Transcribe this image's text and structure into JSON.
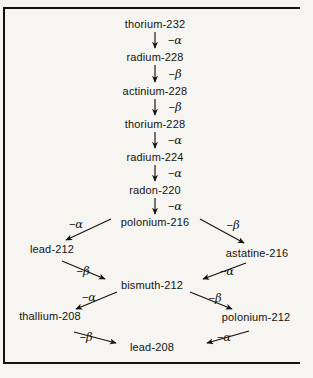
{
  "diagram": {
    "background_color": "#f6f5f1",
    "text_color": "#15130f",
    "nodes": [
      {
        "id": "th232",
        "label": "thorium-232",
        "x": 155,
        "y": 24
      },
      {
        "id": "ra228",
        "label": "radium-228",
        "x": 155,
        "y": 57
      },
      {
        "id": "ac228",
        "label": "actinium-228",
        "x": 155,
        "y": 91
      },
      {
        "id": "th228",
        "label": "thorium-228",
        "x": 155,
        "y": 124
      },
      {
        "id": "ra224",
        "label": "radium-224",
        "x": 155,
        "y": 157
      },
      {
        "id": "rn220",
        "label": "radon-220",
        "x": 155,
        "y": 190
      },
      {
        "id": "po216",
        "label": "polonium-216",
        "x": 155,
        "y": 222
      },
      {
        "id": "pb212",
        "label": "lead-212",
        "x": 52,
        "y": 249
      },
      {
        "id": "at216",
        "label": "astatine-216",
        "x": 257,
        "y": 253
      },
      {
        "id": "bi212",
        "label": "bismuth-212",
        "x": 152,
        "y": 285
      },
      {
        "id": "tl208",
        "label": "thallium-208",
        "x": 50,
        "y": 316
      },
      {
        "id": "po212",
        "label": "polonium-212",
        "x": 256,
        "y": 317
      },
      {
        "id": "pb208",
        "label": "lead-208",
        "x": 152,
        "y": 347
      }
    ],
    "transitions": [
      {
        "from": "th232",
        "to": "ra228",
        "particle": "alpha",
        "label_prefix": "−",
        "label_symbol": "α",
        "label_x": 175,
        "label_y": 40,
        "kind": "vertical"
      },
      {
        "from": "ra228",
        "to": "ac228",
        "particle": "beta",
        "label_prefix": "−",
        "label_symbol": "β",
        "label_x": 175,
        "label_y": 74,
        "kind": "vertical"
      },
      {
        "from": "ac228",
        "to": "th228",
        "particle": "beta",
        "label_prefix": "−",
        "label_symbol": "β",
        "label_x": 175,
        "label_y": 107,
        "kind": "vertical"
      },
      {
        "from": "th228",
        "to": "ra224",
        "particle": "alpha",
        "label_prefix": "−",
        "label_symbol": "α",
        "label_x": 175,
        "label_y": 140,
        "kind": "vertical"
      },
      {
        "from": "ra224",
        "to": "rn220",
        "particle": "alpha",
        "label_prefix": "−",
        "label_symbol": "α",
        "label_x": 175,
        "label_y": 173,
        "kind": "vertical"
      },
      {
        "from": "rn220",
        "to": "po216",
        "particle": "alpha",
        "label_prefix": "−",
        "label_symbol": "α",
        "label_x": 175,
        "label_y": 206,
        "kind": "vertical"
      },
      {
        "from": "po216",
        "to": "pb212",
        "particle": "alpha",
        "label_prefix": "−",
        "label_symbol": "α",
        "label_x": 76,
        "label_y": 224,
        "kind": "diagonal-left"
      },
      {
        "from": "po216",
        "to": "at216",
        "particle": "beta",
        "label_prefix": "−",
        "label_symbol": "β",
        "label_x": 233,
        "label_y": 225,
        "kind": "diagonal-right"
      },
      {
        "from": "pb212",
        "to": "bi212",
        "particle": "beta",
        "label_prefix": "−",
        "label_symbol": "β",
        "label_x": 83,
        "label_y": 271,
        "kind": "diagonal-right"
      },
      {
        "from": "at216",
        "to": "bi212",
        "particle": "alpha",
        "label_prefix": "−",
        "label_symbol": "α",
        "label_x": 227,
        "label_y": 271,
        "kind": "diagonal-left"
      },
      {
        "from": "bi212",
        "to": "tl208",
        "particle": "alpha",
        "label_prefix": "−",
        "label_symbol": "α",
        "label_x": 89,
        "label_y": 297,
        "kind": "diagonal-left"
      },
      {
        "from": "bi212",
        "to": "po212",
        "particle": "beta",
        "label_prefix": "−",
        "label_symbol": "β",
        "label_x": 215,
        "label_y": 298,
        "kind": "diagonal-right"
      },
      {
        "from": "tl208",
        "to": "pb208",
        "particle": "beta",
        "label_prefix": "−",
        "label_symbol": "β",
        "label_x": 86,
        "label_y": 337,
        "kind": "diagonal-right"
      },
      {
        "from": "po212",
        "to": "pb208",
        "particle": "alpha",
        "label_prefix": "−",
        "label_symbol": "α",
        "label_x": 224,
        "label_y": 337,
        "kind": "diagonal-left"
      }
    ],
    "arrow_paths": [
      {
        "id": "a-th232-ra228",
        "x1": 155,
        "y1": 32,
        "x2": 155,
        "y2": 48
      },
      {
        "id": "a-ra228-ac228",
        "x1": 155,
        "y1": 65,
        "x2": 155,
        "y2": 82
      },
      {
        "id": "a-ac228-th228",
        "x1": 155,
        "y1": 99,
        "x2": 155,
        "y2": 115
      },
      {
        "id": "a-th228-ra224",
        "x1": 155,
        "y1": 132,
        "x2": 155,
        "y2": 148
      },
      {
        "id": "a-ra224-rn220",
        "x1": 155,
        "y1": 165,
        "x2": 155,
        "y2": 181
      },
      {
        "id": "a-rn220-po216",
        "x1": 155,
        "y1": 198,
        "x2": 155,
        "y2": 214
      },
      {
        "id": "a-po216-pb212",
        "x1": 111,
        "y1": 219,
        "x2": 66,
        "y2": 240
      },
      {
        "id": "a-po216-at216",
        "x1": 200,
        "y1": 219,
        "x2": 244,
        "y2": 243
      },
      {
        "id": "a-pb212-bi212",
        "x1": 62,
        "y1": 261,
        "x2": 105,
        "y2": 279
      },
      {
        "id": "a-at216-bi212",
        "x1": 246,
        "y1": 263,
        "x2": 203,
        "y2": 279
      },
      {
        "id": "a-bi212-tl208",
        "x1": 117,
        "y1": 292,
        "x2": 76,
        "y2": 309
      },
      {
        "id": "a-bi212-po212",
        "x1": 190,
        "y1": 292,
        "x2": 232,
        "y2": 309
      },
      {
        "id": "a-tl208-pb208",
        "x1": 74,
        "y1": 332,
        "x2": 116,
        "y2": 343
      },
      {
        "id": "a-po212-pb208",
        "x1": 249,
        "y1": 331,
        "x2": 207,
        "y2": 343
      }
    ]
  }
}
